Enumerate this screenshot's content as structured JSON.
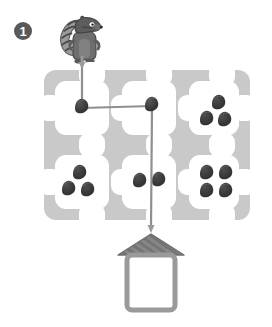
{
  "page": {
    "background_color": "#ffffff",
    "width": 272,
    "height": 327
  },
  "problem": {
    "number_label": "1",
    "badge_color": "#595959",
    "badge_text_color": "#ffffff"
  },
  "character": {
    "name": "squirrel",
    "body_color": "#6e6e6e",
    "dark_color": "#4a4a4a",
    "tail_color": "#8a8a8a",
    "stripe_color": "#3f3f3f",
    "eye_color": "#ffffff"
  },
  "maze": {
    "path_color": "#c9c9c9",
    "cell_color": "#ffffff",
    "rows": 2,
    "cols": 3,
    "bounds": {
      "x": 44,
      "y": 70,
      "width": 206,
      "height": 150
    }
  },
  "nuts": {
    "color": "#3a3a3a",
    "highlight_color": "#5a5a5a",
    "cells": [
      {
        "cell": "top-left",
        "count": 0
      },
      {
        "cell": "top-middle",
        "count": 0
      },
      {
        "cell": "top-right",
        "count": 3
      },
      {
        "cell": "bottom-left",
        "count": 3
      },
      {
        "cell": "bottom-middle",
        "count": 2
      },
      {
        "cell": "bottom-right",
        "count": 4
      }
    ],
    "total_count": 12
  },
  "route": {
    "line_color": "#8f8f8f",
    "node_color": "#3a3a3a",
    "arrow_color": "#9a9a9a",
    "segments": [
      {
        "from": "squirrel",
        "to": "node-1",
        "direction": "down"
      },
      {
        "from": "node-1",
        "to": "node-2",
        "direction": "right"
      },
      {
        "from": "node-2",
        "to": "house",
        "direction": "down"
      }
    ],
    "node_count": 2
  },
  "house": {
    "roof_color": "#6e6e6e",
    "roof_stripe_color": "#8c8c8c",
    "wall_color": "#9a9a9a",
    "interior_color": "#ffffff",
    "answer_value": ""
  }
}
